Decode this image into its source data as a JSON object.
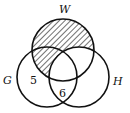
{
  "diagram": {
    "type": "venn",
    "sets": [
      {
        "id": "W",
        "label": "W",
        "cx": 63,
        "cy": 50,
        "r": 31
      },
      {
        "id": "G",
        "label": "G",
        "cx": 47,
        "cy": 77,
        "r": 30
      },
      {
        "id": "H",
        "label": "H",
        "cx": 79,
        "cy": 77,
        "r": 30
      }
    ],
    "region_values": [
      {
        "region": "G only",
        "value": "5"
      },
      {
        "region": "G and H not W",
        "value": "6"
      }
    ],
    "shaded_region": "W minus H (hatched)",
    "colors": {
      "stroke": "#111111",
      "hatch": "#111111",
      "background": "#ffffff"
    }
  }
}
